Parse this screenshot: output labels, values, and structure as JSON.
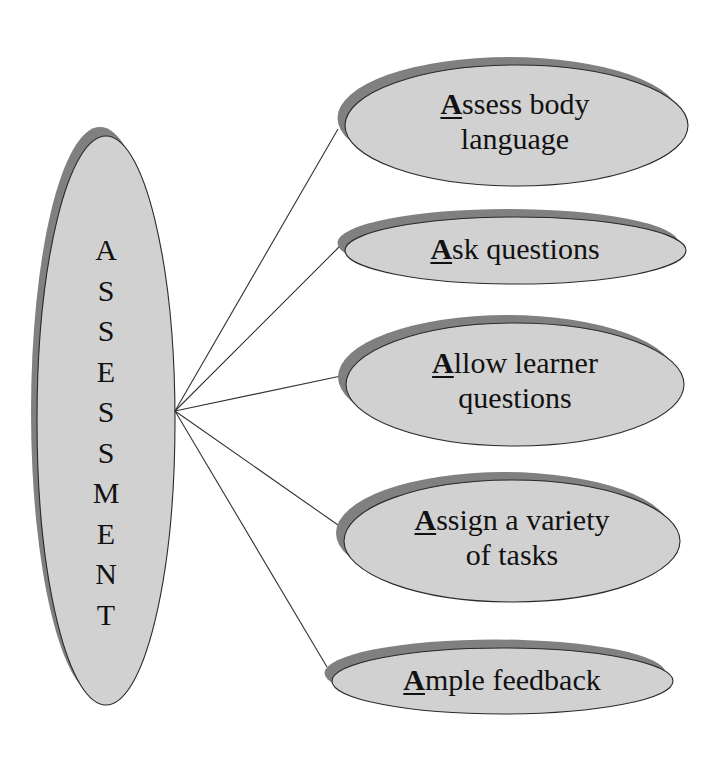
{
  "colors": {
    "fill": "#d1d1d1",
    "shadow": "#808080",
    "outline": "#2a2a2a",
    "connector": "#333333",
    "background": "#ffffff"
  },
  "center": {
    "label": "ASSESSMENT",
    "letters": [
      "A",
      "S",
      "S",
      "E",
      "S",
      "S",
      "M",
      "E",
      "N",
      "T"
    ]
  },
  "branches": [
    {
      "initial": "A",
      "rest_line1": "ssess body",
      "line2": "language"
    },
    {
      "initial": "A",
      "rest_line1": "sk questions",
      "line2": ""
    },
    {
      "initial": "A",
      "rest_line1": "llow learner",
      "line2": "questions"
    },
    {
      "initial": "A",
      "rest_line1": "ssign a variety",
      "line2": "of tasks"
    },
    {
      "initial": "A",
      "rest_line1": "mple feedback",
      "line2": ""
    }
  ]
}
